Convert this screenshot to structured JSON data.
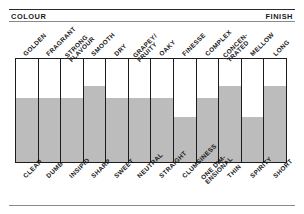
{
  "header": {
    "left_label": "COLOUR",
    "right_label": "FINISH"
  },
  "chart_data": {
    "type": "bar",
    "title": "",
    "subtitle": "",
    "xlabel": "",
    "ylabel": "",
    "ylim": [
      0,
      100
    ],
    "grid": false,
    "legend": "none",
    "orientation": "vertical",
    "fill_color": "#bcbcbc",
    "frame_color": "#1c1c1c",
    "axis_top_header": "COLOUR",
    "axis_bottom_header": "FINISH",
    "categories": [
      "GOLDEN",
      "FRAGRANT",
      "STRONG FLAVOUR",
      "SMOOTH",
      "DRY",
      "GRAPEY/ FRUITY",
      "OAKY",
      "FINESSE",
      "COMPLEX",
      "CONCEN- TRATED",
      "MELLOW",
      "LONG"
    ],
    "categories_negative": [
      "CLEAR",
      "DUMB",
      "INSIPID",
      "SHARP",
      "SWEET",
      "NEUTRAL",
      "STRAIGHT",
      "CLUMSINESS",
      "ONE DIM- ENSIONAL",
      "THIN",
      "SPIRITY",
      "SHORT"
    ],
    "values": [
      62,
      62,
      62,
      74,
      62,
      62,
      62,
      44,
      62,
      74,
      44,
      74
    ]
  },
  "top_labels": [
    {
      "line1": "GOLDEN",
      "line2": ""
    },
    {
      "line1": "FRAGRANT",
      "line2": ""
    },
    {
      "line1": "STRONG",
      "line2": "FLAVOUR"
    },
    {
      "line1": "SMOOTH",
      "line2": ""
    },
    {
      "line1": "DRY",
      "line2": ""
    },
    {
      "line1": "GRAPEY/",
      "line2": "FRUITY"
    },
    {
      "line1": "OAKY",
      "line2": ""
    },
    {
      "line1": "FINESSE",
      "line2": ""
    },
    {
      "line1": "COMPLEX",
      "line2": ""
    },
    {
      "line1": "CONCEN-",
      "line2": "TRATED"
    },
    {
      "line1": "MELLOW",
      "line2": ""
    },
    {
      "line1": "LONG",
      "line2": ""
    }
  ],
  "bottom_labels": [
    {
      "line1": "CLEAR",
      "line2": ""
    },
    {
      "line1": "DUMB",
      "line2": ""
    },
    {
      "line1": "INSIPID",
      "line2": ""
    },
    {
      "line1": "SHARP",
      "line2": ""
    },
    {
      "line1": "SWEET",
      "line2": ""
    },
    {
      "line1": "NEUTRAL",
      "line2": ""
    },
    {
      "line1": "STRAIGHT",
      "line2": ""
    },
    {
      "line1": "CLUMSINESS",
      "line2": ""
    },
    {
      "line1": "ONE DIM-",
      "line2": "ENSIONAL"
    },
    {
      "line1": "THIN",
      "line2": ""
    },
    {
      "line1": "SPIRITY",
      "line2": ""
    },
    {
      "line1": "SHORT",
      "line2": ""
    }
  ]
}
